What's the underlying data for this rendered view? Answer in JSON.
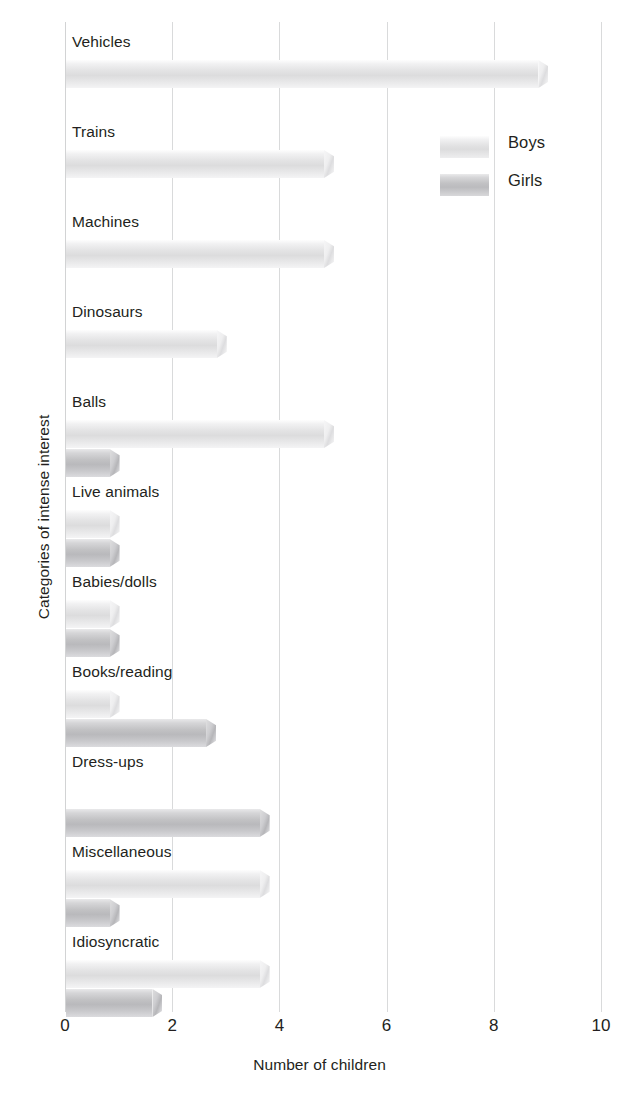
{
  "chart_data": {
    "type": "bar",
    "orientation": "horizontal",
    "title": "",
    "xlabel": "Number of children",
    "ylabel": "Categories of intense interest",
    "xlim": [
      0,
      10
    ],
    "xticks": [
      "0",
      "2",
      "4",
      "6",
      "8",
      "10"
    ],
    "grid": "vertical",
    "legend_position": "upper-right-inside",
    "categories": [
      "Vehicles",
      "Trains",
      "Machines",
      "Dinosaurs",
      "Balls",
      "Live animals",
      "Babies/dolls",
      "Books/reading",
      "Dress-ups",
      "Miscellaneous",
      "Idiosyncratic"
    ],
    "series": [
      {
        "name": "Boys",
        "color": "#e3e3e4",
        "values": [
          9,
          5,
          5,
          3,
          5,
          1,
          1,
          1,
          0,
          3.8,
          3.8
        ]
      },
      {
        "name": "Girls",
        "color": "#c2c2c4",
        "values": [
          0,
          0,
          0,
          0,
          1,
          1,
          1,
          2.8,
          3.8,
          1,
          1.8
        ]
      }
    ]
  },
  "axes": {
    "x_title": "Number of children",
    "y_title": "Categories of intense interest"
  },
  "legend": {
    "entries": [
      {
        "label": "Boys",
        "swatch": "boys-swatch"
      },
      {
        "label": "Girls",
        "swatch": "girls-swatch"
      }
    ]
  }
}
